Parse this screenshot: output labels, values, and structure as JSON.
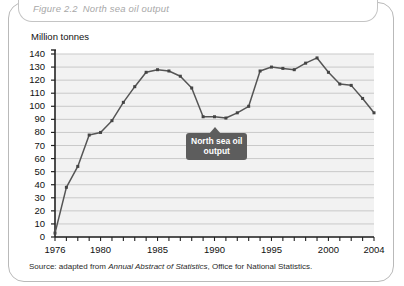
{
  "figure": {
    "number": "Figure 2.2",
    "title": "North sea oil output"
  },
  "source": {
    "prefix": "Source: adapted from ",
    "italic_part": "Annual Abstract of Statistics",
    "suffix": ", Office for National Statistics."
  },
  "callout": {
    "line1": "North sea oil",
    "line2": "output"
  },
  "colors": {
    "line": "#555555",
    "marker": "#444444",
    "grid": "#c9c9c9",
    "axis": "#222222",
    "plot_background": "#f2f2f2",
    "title_text": "#a8a8a8",
    "callout_background": "#5d5d5d",
    "frame_border": "#b9b9b9"
  },
  "chart_data": {
    "type": "line",
    "title": "North sea oil output",
    "xlabel": "",
    "ylabel": "Million tonnes",
    "ylim": [
      0,
      140
    ],
    "ytick_step": 10,
    "yticks": [
      0,
      10,
      20,
      30,
      40,
      50,
      60,
      70,
      80,
      90,
      100,
      110,
      120,
      130,
      140
    ],
    "xlim": [
      1976,
      2004
    ],
    "xticks_labeled": [
      1976,
      1980,
      1985,
      1990,
      1995,
      2000,
      2004
    ],
    "xtick_every_year": true,
    "grid": true,
    "legend": "none",
    "series_name": "North sea oil output",
    "x": [
      1976,
      1977,
      1978,
      1979,
      1980,
      1981,
      1982,
      1983,
      1984,
      1985,
      1986,
      1987,
      1988,
      1989,
      1990,
      1991,
      1992,
      1993,
      1994,
      1995,
      1996,
      1997,
      1998,
      1999,
      2000,
      2001,
      2002,
      2003,
      2004
    ],
    "values": [
      3,
      38,
      54,
      78,
      80,
      89,
      103,
      115,
      126,
      128,
      127,
      123,
      114,
      92,
      92,
      91,
      95,
      100,
      127,
      130,
      129,
      128,
      133,
      137,
      126,
      117,
      116,
      106,
      95
    ],
    "annotations": [
      {
        "text": "North sea oil output",
        "type": "callout",
        "near_year": 1990
      }
    ]
  }
}
